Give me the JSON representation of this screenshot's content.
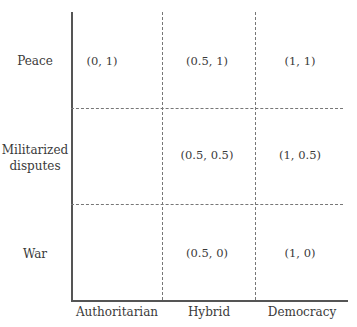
{
  "diagram": {
    "type": "grid",
    "y_axis": {
      "labels": [
        "Peace",
        "Militarized disputes",
        "War"
      ],
      "label_lines": {
        "militarized": [
          "Militarized",
          "disputes"
        ]
      }
    },
    "x_axis": {
      "labels": [
        "Authoritarian",
        "Hybrid",
        "Democracy"
      ]
    },
    "cells": {
      "peace": {
        "authoritarian": "(0, 1)",
        "hybrid": "(0.5, 1)",
        "democracy": "(1, 1)"
      },
      "militarized": {
        "authoritarian": "",
        "hybrid": "(0.5, 0.5)",
        "democracy": "(1, 0.5)"
      },
      "war": {
        "authoritarian": "",
        "hybrid": "(0.5, 0)",
        "democracy": "(1, 0)"
      }
    }
  }
}
